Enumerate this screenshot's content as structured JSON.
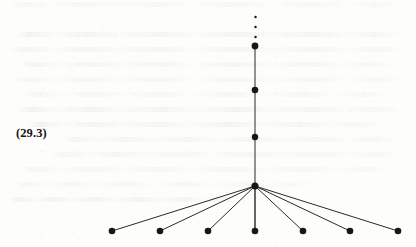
{
  "figure": {
    "equation_label": "(29.3)",
    "caption": "",
    "ink_color": "#191715",
    "edge_color": "#2b2a28",
    "spine_color": "#46443f",
    "page_color": "#fdfdfc"
  },
  "graph": {
    "type": "tree-diagram",
    "hub": {
      "id": "hub",
      "x": 255,
      "y": 186,
      "r": 3.6
    },
    "spine_nodes": [
      {
        "id": "spine-1",
        "x": 255,
        "y": 137,
        "r": 3.2
      },
      {
        "id": "spine-2",
        "x": 255,
        "y": 90,
        "r": 3.3
      },
      {
        "id": "spine-3",
        "x": 255,
        "y": 46,
        "r": 3.4
      }
    ],
    "spine_line": {
      "x1": 255,
      "y1": 46,
      "x2": 255,
      "y2": 231
    },
    "ellipsis_dots": [
      {
        "x": 255.5,
        "y": 37,
        "r": 1.25
      },
      {
        "x": 255.5,
        "y": 27,
        "r": 1.25
      },
      {
        "x": 255.5,
        "y": 17,
        "r": 1.25
      }
    ],
    "leaf_nodes": [
      {
        "id": "leaf-1",
        "x": 112,
        "y": 231,
        "r": 3.3
      },
      {
        "id": "leaf-2",
        "x": 160,
        "y": 231,
        "r": 3.3
      },
      {
        "id": "leaf-3",
        "x": 208,
        "y": 231,
        "r": 3.3
      },
      {
        "id": "leaf-4",
        "x": 255,
        "y": 231,
        "r": 3.3
      },
      {
        "id": "leaf-5",
        "x": 303,
        "y": 231,
        "r": 3.3
      },
      {
        "id": "leaf-6",
        "x": 350,
        "y": 231,
        "r": 3.3
      },
      {
        "id": "leaf-7",
        "x": 398,
        "y": 231,
        "r": 3.3
      }
    ],
    "edges": [
      {
        "id": "edge-hub-leaf-1",
        "x1": 255,
        "y1": 186,
        "x2": 112,
        "y2": 231
      },
      {
        "id": "edge-hub-leaf-2",
        "x1": 255,
        "y1": 186,
        "x2": 160,
        "y2": 231
      },
      {
        "id": "edge-hub-leaf-3",
        "x1": 255,
        "y1": 186,
        "x2": 208,
        "y2": 231
      },
      {
        "id": "edge-hub-leaf-4",
        "x1": 255,
        "y1": 186,
        "x2": 255,
        "y2": 231
      },
      {
        "id": "edge-hub-leaf-5",
        "x1": 255,
        "y1": 186,
        "x2": 303,
        "y2": 231
      },
      {
        "id": "edge-hub-leaf-6",
        "x1": 255,
        "y1": 186,
        "x2": 350,
        "y2": 231
      },
      {
        "id": "edge-hub-leaf-7",
        "x1": 255,
        "y1": 186,
        "x2": 398,
        "y2": 231
      }
    ]
  },
  "bleed_lines": [
    {
      "top": 2,
      "left": 8,
      "width": 398
    },
    {
      "top": 32,
      "left": 14,
      "width": 388
    },
    {
      "top": 47,
      "left": 10,
      "width": 396
    },
    {
      "top": 62,
      "left": 18,
      "width": 380
    },
    {
      "top": 77,
      "left": 12,
      "width": 392
    },
    {
      "top": 92,
      "left": 22,
      "width": 368
    },
    {
      "top": 107,
      "left": 16,
      "width": 386
    },
    {
      "top": 122,
      "left": 26,
      "width": 356
    },
    {
      "top": 137,
      "left": 62,
      "width": 334
    },
    {
      "top": 152,
      "left": 50,
      "width": 350
    },
    {
      "top": 167,
      "left": 20,
      "width": 372
    },
    {
      "top": 182,
      "left": 14,
      "width": 300
    },
    {
      "top": 197,
      "left": 10,
      "width": 228
    }
  ]
}
